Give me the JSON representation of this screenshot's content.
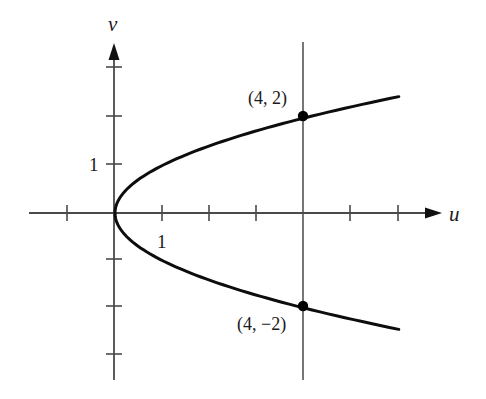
{
  "chart_data": {
    "type": "line",
    "title": "",
    "xlabel": "u",
    "ylabel": "v",
    "equation": "u = v^2",
    "xlim": [
      -1.8,
      6.9
    ],
    "ylim": [
      -3.5,
      3.5
    ],
    "grid": false,
    "legend": null,
    "x_ticks": [
      -1,
      1,
      2,
      3,
      4,
      5,
      6
    ],
    "y_ticks": [
      -3,
      -2,
      -1,
      1,
      2,
      3
    ],
    "tick_labels": {
      "x": [
        {
          "value": 1,
          "text": "1"
        }
      ],
      "y": [
        {
          "value": 1,
          "text": "1"
        }
      ]
    },
    "series": [
      {
        "name": "parabola u = v^2",
        "points": [
          {
            "u": 6.0,
            "v": 2.449
          },
          {
            "u": 4.0,
            "v": 2.0
          },
          {
            "u": 2.25,
            "v": 1.5
          },
          {
            "u": 1.0,
            "v": 1.0
          },
          {
            "u": 0.25,
            "v": 0.5
          },
          {
            "u": 0.0,
            "v": 0.0
          },
          {
            "u": 0.25,
            "v": -0.5
          },
          {
            "u": 1.0,
            "v": -1.0
          },
          {
            "u": 2.25,
            "v": -1.5
          },
          {
            "u": 4.0,
            "v": -2.0
          },
          {
            "u": 6.0,
            "v": -2.449
          }
        ]
      }
    ],
    "reference_lines": [
      {
        "type": "vertical",
        "u": 4
      }
    ],
    "annotations": [
      {
        "text": "(4, 2)",
        "u": 4,
        "v": 2,
        "marker": "filled-dot"
      },
      {
        "text": "(4, −2)",
        "u": 4,
        "v": -2,
        "marker": "filled-dot"
      }
    ]
  },
  "labels": {
    "u_axis": "u",
    "v_axis": "v",
    "u_tick_one": "1",
    "v_tick_one": "1",
    "point_upper": "(4, 2)",
    "point_lower": "(4, −2)"
  },
  "colors": {
    "axis": "#4a4a4a",
    "curve": "#0d0d0d",
    "text": "#1a1a1a"
  }
}
